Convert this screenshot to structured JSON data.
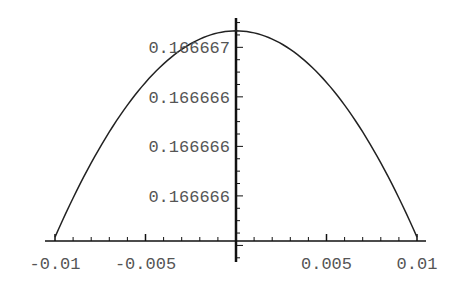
{
  "chart_data": {
    "type": "line",
    "title": "",
    "xlabel": "",
    "ylabel": "",
    "xlim": [
      -0.01,
      0.01
    ],
    "ylim": [
      0.16666583,
      0.16666667
    ],
    "grid": false,
    "legend": null,
    "x_ticks": [
      {
        "value": -0.01,
        "label": "-0.01"
      },
      {
        "value": -0.005,
        "label": "-0.005"
      },
      {
        "value": 0.005,
        "label": "0.005"
      },
      {
        "value": 0.01,
        "label": "0.01"
      }
    ],
    "y_ticks": [
      {
        "value": 0.1666666,
        "label": "0.166667"
      },
      {
        "value": 0.1666664,
        "label": "0.166666"
      },
      {
        "value": 0.1666662,
        "label": "0.166666"
      },
      {
        "value": 0.166666,
        "label": "0.166666"
      }
    ],
    "series": [
      {
        "name": "f(x)",
        "description": "downward parabola peaking at x=0, approx 1/6 - x^2/120",
        "x": [
          -0.01,
          -0.0075,
          -0.005,
          -0.0025,
          0,
          0.0025,
          0.005,
          0.0075,
          0.01
        ],
        "y": [
          0.16666583,
          0.1666662,
          0.16666646,
          0.16666662,
          0.16666667,
          0.16666662,
          0.16666646,
          0.1666662,
          0.16666583
        ]
      }
    ],
    "colors": {
      "curve": "#222222",
      "axes": "#111111",
      "labels": "#555555"
    }
  }
}
